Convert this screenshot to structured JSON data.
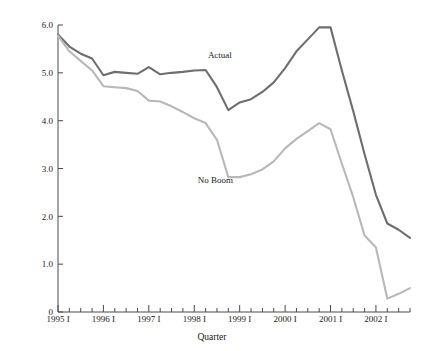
{
  "chart_data": {
    "type": "line",
    "title": "",
    "xlabel": "Quarter",
    "ylabel": "",
    "xlim": [
      0,
      31
    ],
    "ylim": [
      0,
      6.0
    ],
    "grid": false,
    "legend_position": "inline-annotation",
    "y_ticks": [
      "0",
      "1.0",
      "2.0",
      "3.0",
      "4.0",
      "5.0",
      "6.0"
    ],
    "y_tick_values": [
      0,
      1.0,
      2.0,
      3.0,
      4.0,
      5.0,
      6.0
    ],
    "x_tick_labels": [
      "1995 I",
      "1996 I",
      "1997 I",
      "1998 I",
      "1999 I",
      "2000 I",
      "2001 I",
      "2002 I"
    ],
    "x_tick_label_indices": [
      0,
      4,
      8,
      12,
      16,
      20,
      24,
      28
    ],
    "x_minor_tick_count": 32,
    "categories": [
      "1995 I",
      "1995 II",
      "1995 III",
      "1995 IV",
      "1996 I",
      "1996 II",
      "1996 III",
      "1996 IV",
      "1997 I",
      "1997 II",
      "1997 III",
      "1997 IV",
      "1998 I",
      "1998 II",
      "1998 III",
      "1998 IV",
      "1999 I",
      "1999 II",
      "1999 III",
      "1999 IV",
      "2000 I",
      "2000 II",
      "2000 III",
      "2000 IV",
      "2001 I",
      "2001 II",
      "2001 III",
      "2001 IV",
      "2002 I",
      "2002 II",
      "2002 III",
      "2002 IV"
    ],
    "series": [
      {
        "name": "Actual",
        "color": "#6e6e6e",
        "label_x_index": 13.2,
        "label_y_value": 5.32,
        "values": [
          5.8,
          5.55,
          5.4,
          5.3,
          4.95,
          5.02,
          5.0,
          4.98,
          5.12,
          4.97,
          5.0,
          5.02,
          5.05,
          5.06,
          4.7,
          4.22,
          4.38,
          4.45,
          4.6,
          4.8,
          5.1,
          5.45,
          5.7,
          5.95,
          5.95,
          5.05,
          4.2,
          3.3,
          2.45,
          1.85,
          1.72,
          1.55
        ]
      },
      {
        "name": "No Boom",
        "color": "#b8b8b8",
        "label_x_index": 12.3,
        "label_y_value": 2.7,
        "values": [
          5.78,
          5.45,
          5.25,
          5.05,
          4.72,
          4.7,
          4.68,
          4.62,
          4.42,
          4.4,
          4.3,
          4.18,
          4.05,
          3.95,
          3.6,
          2.82,
          2.82,
          2.88,
          2.98,
          3.15,
          3.42,
          3.62,
          3.78,
          3.95,
          3.82,
          3.1,
          2.4,
          1.6,
          1.35,
          0.28,
          0.38,
          0.5
        ]
      }
    ]
  },
  "layout": {
    "plot_left": 58,
    "plot_right": 410,
    "plot_top": 25,
    "plot_bottom": 312
  }
}
